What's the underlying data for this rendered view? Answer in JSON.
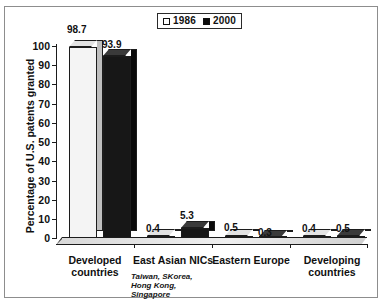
{
  "legend": {
    "entries": [
      {
        "label": "1986",
        "swatch": "white-square-icon"
      },
      {
        "label": "2000",
        "swatch": "black-square-icon"
      }
    ]
  },
  "axes": {
    "y_title": "Percentage of U.S. patents granted",
    "y_ticks": [
      "100",
      "90",
      "80",
      "70",
      "60",
      "50",
      "40",
      "30",
      "20",
      "10",
      "0"
    ]
  },
  "categories": [
    {
      "line1": "Developed",
      "line2": "countries",
      "note": ""
    },
    {
      "line1": "East Asian NICs",
      "line2": "",
      "note": "Taiwan, SKorea,\nHong Kong,\nSingapore"
    },
    {
      "line1": "Eastern Europe",
      "line2": "",
      "note": ""
    },
    {
      "line1": "Developing",
      "line2": "countries",
      "note": ""
    }
  ],
  "values": {
    "developed_1986": "98.7",
    "developed_2000": "93.9",
    "nics_1986": "0.4",
    "nics_2000": "5.3",
    "eeurope_1986": "0.5",
    "eeurope_2000": "0.3",
    "developing_1986": "0.4",
    "developing_2000": "0.5"
  },
  "chart_data": {
    "type": "bar",
    "title": "",
    "subtitle": "",
    "xlabel": "",
    "ylabel": "Percentage of U.S. patents granted",
    "ylim": [
      0,
      100
    ],
    "ytick_interval": 10,
    "yticks": [
      0,
      10,
      20,
      30,
      40,
      50,
      60,
      70,
      80,
      90,
      100
    ],
    "grid": false,
    "legend_position": "top-center",
    "three_d": true,
    "categories": [
      "Developed countries",
      "East Asian NICs",
      "Eastern Europe",
      "Developing countries"
    ],
    "category_notes": {
      "East Asian NICs": "Taiwan, SKorea, Hong Kong, Singapore"
    },
    "series": [
      {
        "name": "1986",
        "color": "#f4f4f4",
        "values": [
          98.7,
          0.4,
          0.5,
          0.4
        ]
      },
      {
        "name": "2000",
        "color": "#171717",
        "values": [
          93.9,
          5.3,
          0.3,
          0.5
        ]
      }
    ],
    "data_labels": [
      {
        "category": "Developed countries",
        "series": "1986",
        "value": 98.7
      },
      {
        "category": "Developed countries",
        "series": "2000",
        "value": 93.9
      },
      {
        "category": "East Asian NICs",
        "series": "1986",
        "value": 0.4
      },
      {
        "category": "East Asian NICs",
        "series": "2000",
        "value": 5.3
      },
      {
        "category": "Eastern Europe",
        "series": "1986",
        "value": 0.5
      },
      {
        "category": "Eastern Europe",
        "series": "2000",
        "value": 0.3
      },
      {
        "category": "Developing countries",
        "series": "1986",
        "value": 0.4
      },
      {
        "category": "Developing countries",
        "series": "2000",
        "value": 0.5
      }
    ]
  }
}
